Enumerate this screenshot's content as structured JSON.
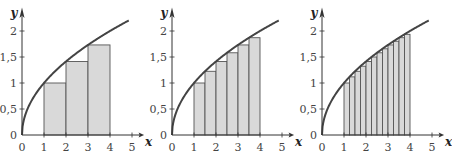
{
  "figure": {
    "panel_count": 3,
    "colors": {
      "curve": "#444444",
      "bar_fill": "#d9d9d9",
      "bar_stroke": "#555555",
      "axis": "#333333",
      "text": "#444444"
    }
  },
  "chart_data": [
    {
      "type": "bar",
      "title": "",
      "function": "y = sqrt(x)",
      "xlabel": "x",
      "ylabel": "y",
      "xlim": [
        0,
        5
      ],
      "ylim": [
        0,
        2.2
      ],
      "x_ticks": [
        "0",
        "1",
        "2",
        "3",
        "4",
        "5"
      ],
      "y_ticks": [
        "0",
        "0,5",
        "1",
        "1,5",
        "2"
      ],
      "grid": false,
      "bar_width": 1,
      "bars": [
        {
          "x0": 1,
          "x1": 2,
          "height": 1.0
        },
        {
          "x0": 2,
          "x1": 3,
          "height": 1.414
        },
        {
          "x0": 3,
          "x1": 4,
          "height": 1.732
        }
      ]
    },
    {
      "type": "bar",
      "title": "",
      "function": "y = sqrt(x)",
      "xlabel": "x",
      "ylabel": "y",
      "xlim": [
        0,
        5
      ],
      "ylim": [
        0,
        2.2
      ],
      "x_ticks": [
        "0",
        "1",
        "2",
        "3",
        "4",
        "5"
      ],
      "y_ticks": [
        "0",
        "0,5",
        "1",
        "1,5",
        "2"
      ],
      "grid": false,
      "bar_width": 0.5,
      "bars": [
        {
          "x0": 1.0,
          "x1": 1.5,
          "height": 1.0
        },
        {
          "x0": 1.5,
          "x1": 2.0,
          "height": 1.225
        },
        {
          "x0": 2.0,
          "x1": 2.5,
          "height": 1.414
        },
        {
          "x0": 2.5,
          "x1": 3.0,
          "height": 1.581
        },
        {
          "x0": 3.0,
          "x1": 3.5,
          "height": 1.732
        },
        {
          "x0": 3.5,
          "x1": 4.0,
          "height": 1.871
        }
      ]
    },
    {
      "type": "bar",
      "title": "",
      "function": "y = sqrt(x)",
      "xlabel": "x",
      "ylabel": "y",
      "xlim": [
        0,
        5
      ],
      "ylim": [
        0,
        2.2
      ],
      "x_ticks": [
        "0",
        "1",
        "2",
        "3",
        "4",
        "5"
      ],
      "y_ticks": [
        "0",
        "0,5",
        "1",
        "1,5",
        "2"
      ],
      "grid": false,
      "bar_width": 0.25,
      "bars": [
        {
          "x0": 1.0,
          "x1": 1.25,
          "height": 1.0
        },
        {
          "x0": 1.25,
          "x1": 1.5,
          "height": 1.118
        },
        {
          "x0": 1.5,
          "x1": 1.75,
          "height": 1.225
        },
        {
          "x0": 1.75,
          "x1": 2.0,
          "height": 1.323
        },
        {
          "x0": 2.0,
          "x1": 2.25,
          "height": 1.414
        },
        {
          "x0": 2.25,
          "x1": 2.5,
          "height": 1.5
        },
        {
          "x0": 2.5,
          "x1": 2.75,
          "height": 1.581
        },
        {
          "x0": 2.75,
          "x1": 3.0,
          "height": 1.658
        },
        {
          "x0": 3.0,
          "x1": 3.25,
          "height": 1.732
        },
        {
          "x0": 3.25,
          "x1": 3.5,
          "height": 1.803
        },
        {
          "x0": 3.5,
          "x1": 3.75,
          "height": 1.871
        },
        {
          "x0": 3.75,
          "x1": 4.0,
          "height": 1.936
        }
      ]
    }
  ]
}
